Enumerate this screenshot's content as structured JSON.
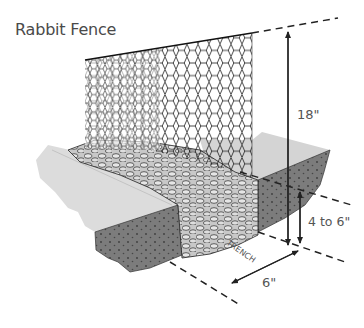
{
  "title": "Rabbit Fence",
  "labels": {
    "height": "18\"",
    "depth": "4 to 6\"",
    "width": "6\"",
    "trench": "TRENCH"
  },
  "colors": {
    "ground_top": "#d6d6d6",
    "soil": "#7a7a7a",
    "mesh": "#1e1e1e",
    "text": "#555555"
  }
}
